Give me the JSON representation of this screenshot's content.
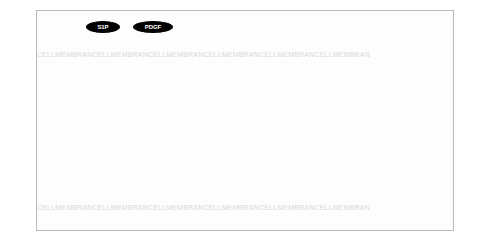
{
  "diagram": {
    "watermark_text": "CELLMEMBRANE",
    "watermark_rows": [
      {
        "y": 44,
        "text": "CELLMEMBRANCELLMEMBRANCELLMEMBRANCELLMEMBRANCELLMEMBRANCELLMEMBRAN"
      },
      {
        "y": 197,
        "text": "CELLMEMBRANCELLMEMBRANCELLMEMBRANCELLMEMBRANCELLMEMBRANCELLMEMBRAN"
      }
    ],
    "colors": {
      "background": "#fdfdfd",
      "border": "#b9b9b9",
      "node_dark": "#000000",
      "node_gray": "#8a8a8a",
      "node_light": "#cfcfcf",
      "node_white": "#ffffff",
      "edge": "#8b8b8b",
      "watermark": "#d8d8d8"
    },
    "nodes": [
      {
        "id": "S1P_lig",
        "label": "S1P",
        "shape": "ellipse",
        "fill": "dark",
        "x": 49,
        "y": 10,
        "w": 34,
        "h": 12
      },
      {
        "id": "PDGF",
        "label": "PDGF",
        "shape": "ellipse",
        "fill": "dark",
        "x": 96,
        "y": 10,
        "w": 40,
        "h": 12
      },
      {
        "id": "Ceramide_top",
        "label": "Ceramide",
        "shape": "ellipse",
        "fill": "white",
        "x": 227,
        "y": 10,
        "w": 44,
        "h": 11
      },
      {
        "id": "FasL_top",
        "label": "FasL",
        "shape": "ellipse",
        "fill": "dark",
        "x": 281,
        "y": 10,
        "w": 30,
        "h": 11
      },
      {
        "id": "sFas",
        "label": "sFas",
        "shape": "ellipse",
        "fill": "dark",
        "x": 320,
        "y": 10,
        "w": 32,
        "h": 11
      },
      {
        "id": "GZMB_top",
        "label": "GZMB",
        "shape": "text",
        "fill": "none",
        "x": 363,
        "y": 10,
        "w": 34,
        "h": 11
      },
      {
        "id": "GPCR",
        "label": "GPCR",
        "shape": "diamond",
        "fill": "lgray",
        "x": 7,
        "y": 28,
        "w": 46,
        "h": 20
      },
      {
        "id": "PDGFR",
        "label": "PDGFR",
        "shape": "diamond",
        "fill": "dark",
        "x": 84,
        "y": 28,
        "w": 60,
        "h": 20
      },
      {
        "id": "CTLA4",
        "label": "CTLA4",
        "shape": "rect",
        "fill": "white",
        "x": 155,
        "y": 31,
        "w": 32,
        "h": 11
      },
      {
        "id": "TCR",
        "label": "TCR",
        "shape": "diamond",
        "fill": "white",
        "x": 196,
        "y": 28,
        "w": 44,
        "h": 18
      },
      {
        "id": "CD95",
        "label": "CD95",
        "shape": "rect",
        "fill": "gray",
        "x": 258,
        "y": 31,
        "w": 28,
        "h": 11
      },
      {
        "id": "FAS",
        "label": "FAS",
        "shape": "diamond",
        "fill": "gray",
        "x": 290,
        "y": 28,
        "w": 46,
        "h": 20
      },
      {
        "id": "RAS_top",
        "label": "RAS",
        "shape": "rect",
        "fill": "gray",
        "x": 345,
        "y": 31,
        "w": 26,
        "h": 11
      },
      {
        "id": "S1P",
        "label": "S1P",
        "shape": "rect",
        "fill": "dark",
        "x": 47,
        "y": 60,
        "w": 28,
        "h": 12
      },
      {
        "id": "SPHK1",
        "label": "SPHK1",
        "shape": "rect",
        "fill": "dark",
        "x": 85,
        "y": 60,
        "w": 34,
        "h": 12
      },
      {
        "id": "PLC",
        "label": "PLC",
        "shape": "rect",
        "fill": "white",
        "x": 123,
        "y": 60,
        "w": 26,
        "h": 11
      },
      {
        "id": "GRB2",
        "label": "GRB2",
        "shape": "rect",
        "fill": "white",
        "x": 156,
        "y": 60,
        "w": 30,
        "h": 11
      },
      {
        "id": "ZAP70",
        "label": "ZAP70",
        "shape": "rect",
        "fill": "white",
        "x": 192,
        "y": 60,
        "w": 32,
        "h": 11
      },
      {
        "id": "FYN",
        "label": "FYN",
        "shape": "rect",
        "fill": "white",
        "x": 230,
        "y": 60,
        "w": 26,
        "h": 11
      },
      {
        "id": "CREB",
        "label": "CREB",
        "shape": "rect",
        "fill": "white",
        "x": 261,
        "y": 60,
        "w": 30,
        "h": 11
      },
      {
        "id": "LCK",
        "label": "LCK",
        "shape": "rect",
        "fill": "dark",
        "x": 184,
        "y": 43,
        "w": 30,
        "h": 12
      },
      {
        "id": "Ceramide_in",
        "label": "Ceramide",
        "shape": "rect",
        "fill": "white",
        "x": 262,
        "y": 46,
        "w": 40,
        "h": 11
      },
      {
        "id": "DISC",
        "label": "DISC",
        "shape": "rect",
        "fill": "gray",
        "x": 313,
        "y": 59,
        "w": 28,
        "h": 11
      },
      {
        "id": "CASPASE",
        "label": "CASPASE",
        "shape": "rect",
        "fill": "gray",
        "x": 350,
        "y": 59,
        "w": 42,
        "h": 11
      },
      {
        "id": "FLIP",
        "label": "FLIP",
        "shape": "rect",
        "fill": "dark",
        "x": 310,
        "y": 73,
        "w": 28,
        "h": 12
      },
      {
        "id": "MC11",
        "label": "MC11",
        "shape": "rect",
        "fill": "dark",
        "x": 345,
        "y": 73,
        "w": 30,
        "h": 12
      },
      {
        "id": "RID",
        "label": "RID",
        "shape": "rect",
        "fill": "white",
        "x": 394,
        "y": 73,
        "w": 26,
        "h": 11
      },
      {
        "id": "IAP",
        "label": "IAP",
        "shape": "rect",
        "fill": "white",
        "x": 428,
        "y": 73,
        "w": 24,
        "h": 11
      },
      {
        "id": "GAP",
        "label": "GAP",
        "shape": "rect",
        "fill": "white",
        "x": 96,
        "y": 95,
        "w": 28,
        "h": 11
      },
      {
        "id": "RAS",
        "label": "RAS",
        "shape": "rect",
        "fill": "gray",
        "x": 136,
        "y": 95,
        "w": 28,
        "h": 12
      },
      {
        "id": "Cytoskeleton",
        "label": "Cytoskeleton",
        "shape": "burst",
        "fill": "gray",
        "x": 178,
        "y": 92,
        "w": 74,
        "h": 26
      },
      {
        "id": "GZMB",
        "label": "GZMB",
        "shape": "rect",
        "fill": "dark",
        "x": 232,
        "y": 96,
        "w": 34,
        "h": 12
      },
      {
        "id": "Fast",
        "label": "Fast",
        "shape": "rect",
        "fill": "dark",
        "x": 312,
        "y": 96,
        "w": 26,
        "h": 12
      },
      {
        "id": "Bcbl",
        "label": "Bcbl",
        "shape": "rect",
        "fill": "gray",
        "x": 360,
        "y": 100,
        "w": 28,
        "h": 11
      },
      {
        "id": "MEK",
        "label": "MEK",
        "shape": "rect",
        "fill": "dark",
        "x": 140,
        "y": 124,
        "w": 28,
        "h": 12
      },
      {
        "id": "PI3K",
        "label": "PI3K",
        "shape": "rect",
        "fill": "dark",
        "x": 175,
        "y": 124,
        "w": 30,
        "h": 12
      },
      {
        "id": "NFkB",
        "label": "NFkB",
        "shape": "rect",
        "fill": "white",
        "x": 354,
        "y": 124,
        "w": 30,
        "h": 11
      },
      {
        "id": "TRADD",
        "label": "TRADD",
        "shape": "rect",
        "fill": "white",
        "x": 414,
        "y": 124,
        "w": 34,
        "h": 11
      },
      {
        "id": "EAK",
        "label": "EAK",
        "shape": "rect",
        "fill": "dark",
        "x": 140,
        "y": 150,
        "w": 28,
        "h": 12
      },
      {
        "id": "NFAT",
        "label": "NFAT",
        "shape": "rect",
        "fill": "white",
        "x": 174,
        "y": 150,
        "w": 30,
        "h": 11
      },
      {
        "id": "TBET",
        "label": "TBET",
        "shape": "rect",
        "fill": "white",
        "x": 232,
        "y": 150,
        "w": 30,
        "h": 11
      },
      {
        "id": "P27",
        "label": "P27",
        "shape": "rect",
        "fill": "white",
        "x": 270,
        "y": 150,
        "w": 26,
        "h": 11
      },
      {
        "id": "STAT3",
        "label": "STAT3",
        "shape": "rect",
        "fill": "dark",
        "x": 301,
        "y": 150,
        "w": 32,
        "h": 12
      },
      {
        "id": "IL2RAT",
        "label": "IL2RAT",
        "shape": "rect",
        "fill": "gray",
        "x": 351,
        "y": 150,
        "w": 34,
        "h": 12
      },
      {
        "id": "A20",
        "label": "A20",
        "shape": "rect",
        "fill": "dark",
        "x": 405,
        "y": 150,
        "w": 28,
        "h": 12
      },
      {
        "id": "Proliferation",
        "label": "Proliferation",
        "shape": "burst",
        "fill": "gray",
        "x": 258,
        "y": 128,
        "w": 64,
        "h": 22
      },
      {
        "id": "IL2RBT",
        "label": "IL2RBT",
        "shape": "rect",
        "fill": "dark",
        "x": 133,
        "y": 172,
        "w": 36,
        "h": 12
      },
      {
        "id": "IFNGT",
        "label": "IFNGT",
        "shape": "rect",
        "fill": "gray",
        "x": 172,
        "y": 172,
        "w": 32,
        "h": 12
      },
      {
        "id": "IAK",
        "label": "IAK",
        "shape": "rect",
        "fill": "dark",
        "x": 242,
        "y": 172,
        "w": 28,
        "h": 12
      },
      {
        "id": "SOCS",
        "label": "SOCS",
        "shape": "rect",
        "fill": "white",
        "x": 277,
        "y": 172,
        "w": 32,
        "h": 11
      },
      {
        "id": "TPL2",
        "label": "TPL2",
        "shape": "rect",
        "fill": "dark",
        "x": 357,
        "y": 172,
        "w": 30,
        "h": 12
      },
      {
        "id": "TAX",
        "label": "TAX",
        "shape": "rect",
        "fill": "white",
        "x": 398,
        "y": 172,
        "w": 26,
        "h": 11
      },
      {
        "id": "SMAD",
        "label": "SMAD",
        "shape": "rect",
        "fill": "white",
        "x": 12,
        "y": 150,
        "w": 36,
        "h": 12
      },
      {
        "id": "IL2RB",
        "label": "IL2RB",
        "shape": "diamond",
        "fill": "dark",
        "x": 174,
        "y": 185,
        "w": 52,
        "h": 20
      },
      {
        "id": "IL2RA",
        "label": "IL2RA",
        "shape": "ellipse",
        "fill": "gray",
        "x": 310,
        "y": 190,
        "w": 44,
        "h": 12
      },
      {
        "id": "ENG",
        "label": "ENG",
        "shape": "ellipse",
        "fill": "gray",
        "x": 130,
        "y": 209,
        "w": 38,
        "h": 11
      },
      {
        "id": "IL15",
        "label": "IL15",
        "shape": "ellipse",
        "fill": "dark",
        "x": 186,
        "y": 209,
        "w": 34,
        "h": 11
      },
      {
        "id": "IL2",
        "label": "IL2",
        "shape": "ellipse",
        "fill": "dark",
        "x": 262,
        "y": 209,
        "w": 34,
        "h": 11
      },
      {
        "id": "RANTES",
        "label": "RANTES",
        "shape": "ellipse",
        "fill": "dark",
        "x": 305,
        "y": 209,
        "w": 48,
        "h": 11
      },
      {
        "id": "TNF",
        "label": "TNF",
        "shape": "ellipse",
        "fill": "white",
        "x": 410,
        "y": 209,
        "w": 36,
        "h": 11
      }
    ],
    "edges": [
      [
        "PDGF",
        "S1P_lig"
      ],
      [
        "PDGF",
        "PDGFR"
      ],
      [
        "S1P_lig",
        "GPCR"
      ],
      [
        "S1P_lig",
        "PDGFR"
      ],
      [
        "GPCR",
        "SMAD"
      ],
      [
        "S1P",
        "S1P_lig"
      ],
      [
        "SPHK1",
        "S1P"
      ],
      [
        "PDGFR",
        "SPHK1"
      ],
      [
        "PDGFR",
        "PLC"
      ],
      [
        "PDGFR",
        "GRB2"
      ],
      [
        "PDGFR",
        "RAS"
      ],
      [
        "PDGFR",
        "CTLA4"
      ],
      [
        "PLC",
        "GRB2"
      ],
      [
        "GRB2",
        "ZAP70"
      ],
      [
        "ZAP70",
        "FYN"
      ],
      [
        "FYN",
        "CREB"
      ],
      [
        "TCR",
        "CTLA4"
      ],
      [
        "TCR",
        "LCK"
      ],
      [
        "LCK",
        "ZAP70"
      ],
      [
        "LCK",
        "FYN"
      ],
      [
        "LCK",
        "GRB2"
      ],
      [
        "RAS",
        "GAP"
      ],
      [
        "RAS",
        "MEK"
      ],
      [
        "RAS",
        "PI3K"
      ],
      [
        "PLC",
        "RAS"
      ],
      [
        "ZAP70",
        "Cytoskeleton"
      ],
      [
        "FYN",
        "Cytoskeleton"
      ],
      [
        "CREB",
        "GZMB"
      ],
      [
        "Ceramide_top",
        "CD95"
      ],
      [
        "FasL_top",
        "FAS"
      ],
      [
        "sFas",
        "FAS"
      ],
      [
        "CD95",
        "FAS"
      ],
      [
        "FAS",
        "DISC"
      ],
      [
        "DISC",
        "CASPASE"
      ],
      [
        "FLIP",
        "DISC"
      ],
      [
        "MC11",
        "CASPASE"
      ],
      [
        "CASPASE",
        "RID"
      ],
      [
        "RID",
        "IAP"
      ],
      [
        "GZMB_top",
        "CASPASE"
      ],
      [
        "Ceramide_in",
        "DISC"
      ],
      [
        "MEK",
        "EAK"
      ],
      [
        "PI3K",
        "NFAT"
      ],
      [
        "PI3K",
        "EAK"
      ],
      [
        "EAK",
        "IL2RBT"
      ],
      [
        "NFAT",
        "IFNGT"
      ],
      [
        "IL2RBT",
        "IL2RB"
      ],
      [
        "IFNGT",
        "IL2RB"
      ],
      [
        "TBET",
        "IAK"
      ],
      [
        "IAK",
        "SOCS"
      ],
      [
        "STAT3",
        "IL2RAT"
      ],
      [
        "STAT3",
        "Proliferation"
      ],
      [
        "NFkB",
        "IL2RAT"
      ],
      [
        "NFkB",
        "A20"
      ],
      [
        "TRADD",
        "NFkB"
      ],
      [
        "TRADD",
        "A20"
      ],
      [
        "TPL2",
        "NFkB"
      ],
      [
        "TAX",
        "TPL2"
      ],
      [
        "IL2RAT",
        "IL2RA"
      ],
      [
        "IL2RB",
        "IL2"
      ],
      [
        "IL2RB",
        "IL15"
      ],
      [
        "IL2RB",
        "ENG"
      ],
      [
        "SMAD",
        "ENG"
      ],
      [
        "IL2",
        "IAK"
      ],
      [
        "RANTES",
        "IL2RA"
      ],
      [
        "TNF",
        "TRADD"
      ],
      [
        "Bcbl",
        "CASPASE"
      ],
      [
        "Fast",
        "DISC"
      ],
      [
        "RAS_top",
        "FAS"
      ]
    ]
  }
}
